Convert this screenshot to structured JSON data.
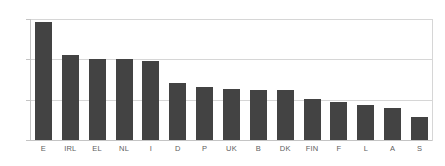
{
  "chart_data": {
    "type": "bar",
    "title": "",
    "subtitle": "",
    "xlabel": "",
    "ylabel": "",
    "categories": [
      "E",
      "IRL",
      "EL",
      "NL",
      "I",
      "D",
      "P",
      "UK",
      "B",
      "DK",
      "FIN",
      "F",
      "L",
      "A",
      "S"
    ],
    "values": [
      1170,
      840,
      805,
      805,
      780,
      565,
      530,
      510,
      500,
      495,
      405,
      380,
      345,
      315,
      225
    ],
    "series": [
      {
        "name": "",
        "values": [
          1170,
          840,
          805,
          805,
          780,
          565,
          530,
          510,
          500,
          495,
          405,
          380,
          345,
          315,
          225
        ]
      }
    ],
    "ylim": [
      0,
      1200
    ],
    "yticks": [
      0,
      400,
      800,
      1200
    ],
    "ytick_labels": [
      "0",
      "400",
      "800",
      "1,200"
    ],
    "grid": true,
    "grid_axis": "y",
    "legend": false,
    "legend_position": "none",
    "bar_color": "#434343",
    "grid_color": "#d6d6d6",
    "axis_color": "#c4c4c4",
    "tick_label_color": "#6e6e6e",
    "category_label_color": "#5e5e5e",
    "background_color": "#ffffff"
  }
}
